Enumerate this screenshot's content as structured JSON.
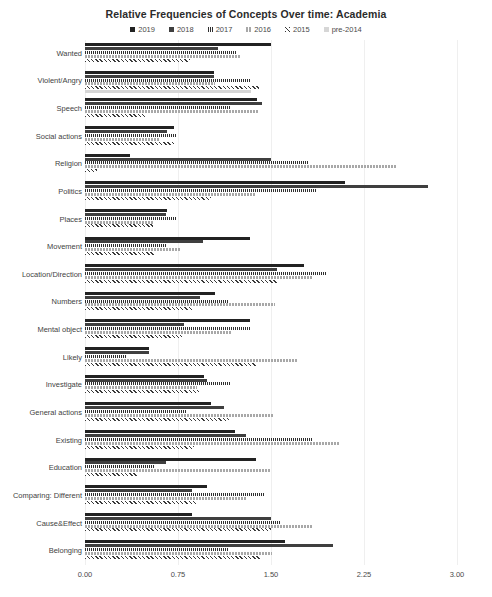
{
  "chart_data": {
    "type": "bar",
    "orientation": "horizontal",
    "title": "Relative Frequencies of Concepts Over time: Academia",
    "xlabel": "",
    "ylabel": "",
    "xlim": [
      0.0,
      3.0
    ],
    "xticks": [
      "0.00",
      "0.75",
      "1.50",
      "2.25",
      "3.00"
    ],
    "xtick_values": [
      0.0,
      0.75,
      1.5,
      2.25,
      3.0
    ],
    "grid": true,
    "legend_position": "top-center",
    "categories": [
      "Wanted",
      "Violent/Angry",
      "Speech",
      "Social actions",
      "Religion",
      "Politics",
      "Places",
      "Movement",
      "Location/Direction",
      "Numbers",
      "Mental object",
      "Likely",
      "Investigate",
      "General actions",
      "Existing",
      "Education",
      "Comparing: Different",
      "Cause&Effect",
      "Belonging"
    ],
    "series": [
      {
        "name": "2019",
        "color": "#222222",
        "values": [
          1.5,
          1.04,
          1.39,
          0.72,
          0.36,
          2.1,
          0.66,
          1.33,
          1.77,
          1.05,
          1.33,
          0.52,
          0.96,
          1.02,
          1.21,
          1.38,
          0.98,
          0.86,
          1.61
        ]
      },
      {
        "name": "2018",
        "color": "#3f3f3f",
        "values": [
          1.07,
          1.04,
          1.43,
          0.66,
          1.5,
          2.77,
          0.65,
          0.95,
          1.55,
          0.93,
          0.8,
          0.52,
          0.98,
          1.12,
          1.3,
          0.65,
          0.86,
          1.5,
          2.0
        ]
      },
      {
        "name": "2017",
        "color": "#2f2f2f",
        "values": [
          1.22,
          1.34,
          1.18,
          0.74,
          1.8,
          1.86,
          0.74,
          0.66,
          1.94,
          1.16,
          1.34,
          0.33,
          1.18,
          0.82,
          1.83,
          0.56,
          1.44,
          1.58,
          1.16
        ]
      },
      {
        "name": "2016",
        "color": "#a8a8a8",
        "values": [
          1.25,
          1.05,
          1.4,
          0.6,
          2.52,
          1.38,
          0.55,
          0.77,
          1.83,
          1.53,
          1.18,
          1.72,
          0.9,
          1.52,
          2.06,
          1.5,
          1.3,
          1.84,
          1.51
        ]
      },
      {
        "name": "2015",
        "color": "#3a3a3a",
        "values": [
          0.85,
          1.4,
          0.48,
          0.72,
          0.1,
          1.02,
          0.55,
          0.56,
          1.55,
          0.86,
          0.78,
          1.38,
          0.92,
          1.16,
          0.88,
          0.42,
          0.9,
          1.5,
          1.42
        ]
      },
      {
        "name": "pre-2014",
        "color": "#d6d6d6",
        "values": [
          0.0,
          1.34,
          0.0,
          0.0,
          0.0,
          0.0,
          0.0,
          0.0,
          0.0,
          0.0,
          0.0,
          0.0,
          0.0,
          0.0,
          0.0,
          0.0,
          0.0,
          0.0,
          0.0
        ]
      }
    ]
  },
  "legend": {
    "items": [
      {
        "label": "2019"
      },
      {
        "label": "2018"
      },
      {
        "label": "2017"
      },
      {
        "label": "2016"
      },
      {
        "label": "2015"
      },
      {
        "label": "pre-2014"
      }
    ]
  }
}
